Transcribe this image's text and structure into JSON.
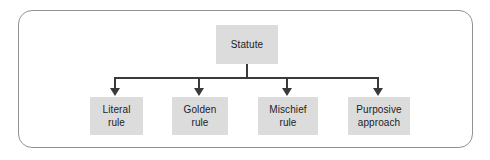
{
  "diagram": {
    "type": "tree-flowchart",
    "orientation": "top-down",
    "colors": {
      "node_fill": "#dcdcdc",
      "node_text": "#1c1c1c",
      "connector": "#3a3a3a",
      "frame_border": "#8f9296",
      "background": "#ffffff"
    },
    "root": {
      "id": "statute",
      "label": "Statute"
    },
    "children": [
      {
        "id": "literal-rule",
        "label": "Literal\nrule"
      },
      {
        "id": "golden-rule",
        "label": "Golden\nrule"
      },
      {
        "id": "mischief-rule",
        "label": "Mischief\nrule"
      },
      {
        "id": "purposive-approach",
        "label": "Purposive\napproach"
      }
    ],
    "connectors": {
      "stem_from": "statute",
      "arrow_count": 4,
      "arrow_direction": "down"
    }
  }
}
